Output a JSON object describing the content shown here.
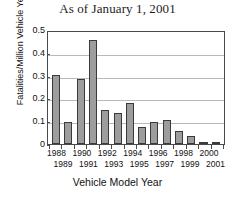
{
  "figure": {
    "clipped_top_line": "___ ______ __ ____",
    "title": "As of January 1, 2001",
    "xtitle": "Vehicle Model Year",
    "ylabel": "Fatalities/Million Vehicle Years"
  },
  "chart_data": {
    "type": "bar",
    "title": "As of January 1, 2001",
    "xlabel": "Vehicle Model Year",
    "ylabel": "Fatalities/Million Vehicle Years",
    "categories": [
      "1988",
      "1989",
      "1990",
      "1991",
      "1992",
      "1993",
      "1994",
      "1995",
      "1996",
      "1997",
      "1998",
      "1999",
      "2000",
      "2001"
    ],
    "values": [
      0.31,
      0.1,
      0.29,
      0.465,
      0.15,
      0.14,
      0.185,
      0.075,
      0.1,
      0.105,
      0.06,
      0.035,
      0.005,
      0.003
    ],
    "ylim": [
      0,
      0.5
    ],
    "yticks": [
      "0",
      "0.1",
      "0.2",
      "0.3",
      "0.4",
      "0.5"
    ],
    "ytick_values": [
      0,
      0.1,
      0.2,
      0.3,
      0.4,
      0.5
    ],
    "xtick_labels_top": [
      "1988",
      "",
      "1990",
      "",
      "1992",
      "",
      "1994",
      "",
      "1996",
      "",
      "1998",
      "",
      "2000",
      ""
    ],
    "xtick_labels_bottom": [
      "",
      "1989",
      "",
      "1991",
      "",
      "1993",
      "",
      "1995",
      "",
      "1997",
      "",
      "1999",
      "",
      "2001"
    ],
    "grid": true,
    "legend": null,
    "bar_color": "#9d9d9d",
    "bar_edge_color": "#3a3a3a",
    "axis_color": "#4a4a4a",
    "grid_color": "#b9b9b9"
  }
}
